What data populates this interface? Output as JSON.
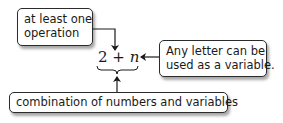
{
  "expression": {
    "number": "2",
    "operator": "+",
    "variable": "n"
  },
  "callouts": {
    "operation": {
      "lines": [
        "at least one",
        "operation"
      ]
    },
    "variable": {
      "lines": [
        "Any letter can be",
        "used as a variable."
      ]
    },
    "combination": {
      "text": "combination of numbers and variables"
    }
  }
}
